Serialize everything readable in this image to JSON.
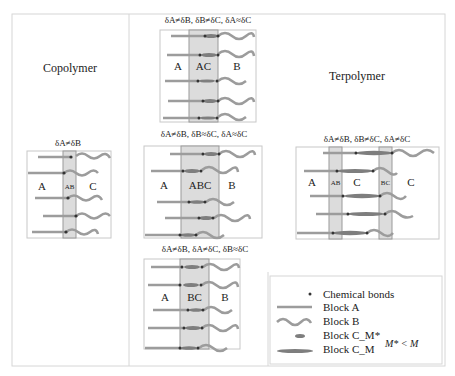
{
  "diagram": {
    "colors": {
      "frame": "#d6d6d6",
      "box": "#c8c8c8",
      "shade": "#dcdcdc",
      "interface": "#9a9a9a",
      "blockA": "#9c9c9c",
      "blockB": "#9c9c9c",
      "blockC": "#7e7e7e",
      "bond": "#333333",
      "text": "#222222"
    },
    "sections": {
      "copolymer": {
        "title": "Copolymer"
      },
      "terpolymer": {
        "title": "Terpolymer"
      }
    },
    "panels": [
      {
        "id": "copolymer",
        "condition": "δA≠δB",
        "labels": [
          "A",
          "AB",
          "C"
        ]
      },
      {
        "id": "ter-ac",
        "condition": "δA≠δB, δB≠δC, δA≈δC",
        "labels": [
          "A",
          "AC",
          "B"
        ]
      },
      {
        "id": "ter-abc",
        "condition": "δA≠δB, δB≈δC, δA≈δC",
        "labels": [
          "A",
          "ABC",
          "B"
        ]
      },
      {
        "id": "ter-bc",
        "condition": "δA≠δB, δA≠δC, δB≈δC",
        "labels": [
          "A",
          "BC",
          "B"
        ]
      },
      {
        "id": "ter-ab-bc",
        "condition": "δA≠δB, δB≠δC, δA≠δC",
        "labels": [
          "A",
          "AB",
          "C",
          "BC",
          "C"
        ]
      }
    ],
    "legend": {
      "items": [
        "Chemical bonds",
        "Block A",
        "Block B",
        "Block C_M*",
        "Block C_M"
      ],
      "note": "M* < M"
    }
  }
}
